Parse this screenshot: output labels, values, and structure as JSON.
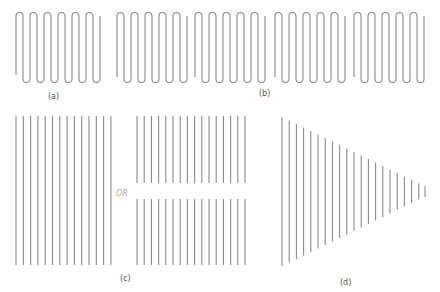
{
  "figure": {
    "panels": [
      {
        "id": "a",
        "label": "(a)",
        "description": "single serpentine (meander) conductor with 5 loops"
      },
      {
        "id": "b",
        "label": "(b)",
        "description": "four serpentine conductor segments placed side by side"
      },
      {
        "id": "c",
        "label": "(c)",
        "description": "array of parallel straight conductors, or split into two rows"
      },
      {
        "id": "d",
        "label": "(d)",
        "description": "parallel conductors of decreasing length forming a tapered array"
      }
    ],
    "or_text": "OR",
    "colors": {
      "line": "#8a8a8a",
      "label": "#555555",
      "or": "#aaaaaa",
      "background": "#ffffff"
    }
  }
}
